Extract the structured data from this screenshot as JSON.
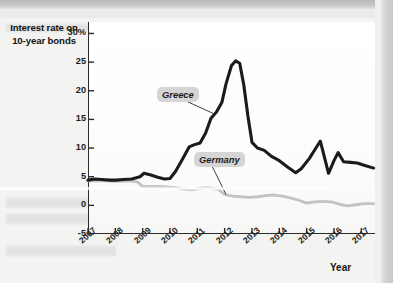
{
  "chart_data": {
    "type": "line",
    "title": "",
    "ylabel": "Interest rate on 10-year bonds",
    "xlabel": "Year",
    "ytick_labels": [
      "30%",
      "25",
      "20",
      "15",
      "10",
      "5",
      "0",
      "-5"
    ],
    "ytick_values": [
      30,
      25,
      20,
      15,
      10,
      5,
      0,
      -5
    ],
    "ylim": [
      -5,
      32
    ],
    "xlim": [
      2007,
      2017.5
    ],
    "categories": [
      "2007",
      "2008",
      "2009",
      "2010",
      "2011",
      "2012",
      "2013",
      "2014",
      "2015",
      "2016",
      "2017"
    ],
    "grid": false,
    "legend": "inline-annotations",
    "series": [
      {
        "name": "Greece",
        "color": "#1b1b1b",
        "points": [
          [
            2007.0,
            4.4
          ],
          [
            2007.25,
            4.6
          ],
          [
            2007.5,
            4.5
          ],
          [
            2007.8,
            4.4
          ],
          [
            2008.0,
            4.4
          ],
          [
            2008.3,
            4.5
          ],
          [
            2008.6,
            4.6
          ],
          [
            2008.9,
            5.0
          ],
          [
            2009.05,
            5.6
          ],
          [
            2009.3,
            5.3
          ],
          [
            2009.55,
            4.9
          ],
          [
            2009.8,
            4.6
          ],
          [
            2010.0,
            4.7
          ],
          [
            2010.2,
            5.9
          ],
          [
            2010.45,
            8.0
          ],
          [
            2010.7,
            10.2
          ],
          [
            2010.9,
            10.6
          ],
          [
            2011.1,
            10.9
          ],
          [
            2011.3,
            12.6
          ],
          [
            2011.5,
            15.2
          ],
          [
            2011.7,
            16.3
          ],
          [
            2011.9,
            18.0
          ],
          [
            2012.05,
            21.2
          ],
          [
            2012.25,
            24.4
          ],
          [
            2012.4,
            25.2
          ],
          [
            2012.55,
            24.8
          ],
          [
            2012.7,
            21.0
          ],
          [
            2012.85,
            15.6
          ],
          [
            2013.0,
            11.0
          ],
          [
            2013.2,
            10.0
          ],
          [
            2013.45,
            9.6
          ],
          [
            2013.7,
            8.6
          ],
          [
            2014.0,
            7.8
          ],
          [
            2014.3,
            6.7
          ],
          [
            2014.6,
            5.7
          ],
          [
            2014.8,
            6.4
          ],
          [
            2015.1,
            8.2
          ],
          [
            2015.35,
            10.1
          ],
          [
            2015.5,
            11.2
          ],
          [
            2015.65,
            8.4
          ],
          [
            2015.8,
            5.6
          ],
          [
            2016.0,
            7.8
          ],
          [
            2016.15,
            9.2
          ],
          [
            2016.35,
            7.6
          ],
          [
            2016.6,
            7.5
          ],
          [
            2016.85,
            7.4
          ],
          [
            2017.1,
            7.0
          ],
          [
            2017.45,
            6.5
          ]
        ]
      },
      {
        "name": "Germany",
        "color": "#c3c3c3",
        "points": [
          [
            2007.0,
            4.3
          ],
          [
            2007.3,
            4.3
          ],
          [
            2007.6,
            4.3
          ],
          [
            2007.9,
            4.2
          ],
          [
            2008.2,
            4.2
          ],
          [
            2008.5,
            4.3
          ],
          [
            2008.8,
            4.1
          ],
          [
            2009.0,
            3.3
          ],
          [
            2009.3,
            3.3
          ],
          [
            2009.6,
            3.3
          ],
          [
            2009.9,
            3.2
          ],
          [
            2010.2,
            3.1
          ],
          [
            2010.5,
            2.8
          ],
          [
            2010.8,
            2.7
          ],
          [
            2011.0,
            2.9
          ],
          [
            2011.3,
            3.1
          ],
          [
            2011.55,
            3.0
          ],
          [
            2011.8,
            2.7
          ],
          [
            2012.0,
            1.9
          ],
          [
            2012.3,
            1.6
          ],
          [
            2012.6,
            1.5
          ],
          [
            2012.9,
            1.4
          ],
          [
            2013.2,
            1.5
          ],
          [
            2013.5,
            1.7
          ],
          [
            2013.8,
            1.8
          ],
          [
            2014.1,
            1.6
          ],
          [
            2014.4,
            1.3
          ],
          [
            2014.7,
            0.9
          ],
          [
            2015.0,
            0.4
          ],
          [
            2015.3,
            0.6
          ],
          [
            2015.6,
            0.7
          ],
          [
            2015.9,
            0.6
          ],
          [
            2016.2,
            0.2
          ],
          [
            2016.5,
            -0.1
          ],
          [
            2016.8,
            0.1
          ],
          [
            2017.1,
            0.3
          ],
          [
            2017.45,
            0.3
          ]
        ]
      }
    ],
    "annotations": [
      {
        "text": "Greece",
        "target_x": 2011.6,
        "target_y": 16.0
      },
      {
        "text": "Germany",
        "target_x": 2012.05,
        "target_y": 1.9
      }
    ]
  }
}
